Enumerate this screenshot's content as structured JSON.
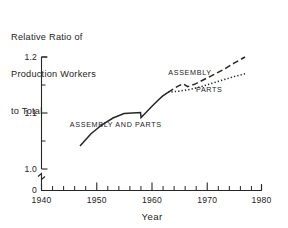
{
  "chart_data": {
    "type": "line",
    "title": "Relative Ratio of Production Workers to Total",
    "title_lines": [
      "Relative Ratio of",
      "Production Workers",
      "to Total"
    ],
    "xlabel": "Year",
    "ylabel": "",
    "xlim": [
      1940,
      1980
    ],
    "ylim": [
      1.0,
      1.2
    ],
    "y_axis_break": true,
    "y_break_label": "0",
    "grid": false,
    "legend": "inline-annotations",
    "yticks": [
      1.0,
      1.1,
      1.2
    ],
    "ytick_labels": [
      "1.0",
      "1.1",
      "1.2"
    ],
    "yticks_minor": [
      1.05,
      1.15
    ],
    "xticks": [
      1940,
      1950,
      1960,
      1970,
      1980
    ],
    "xtick_labels": [
      "1940",
      "1950",
      "1960",
      "1970",
      "1980"
    ],
    "xticks_minor": [
      1942,
      1944,
      1946,
      1948,
      1952,
      1954,
      1956,
      1958,
      1962,
      1964,
      1966,
      1968,
      1972,
      1974,
      1976,
      1978
    ],
    "series": [
      {
        "name": "ASSEMBLY AND PARTS",
        "style": "solid",
        "label": "ASSEMBLY AND PARTS",
        "x": [
          1947,
          1949,
          1951,
          1953,
          1955,
          1956.5,
          1958,
          1958.1,
          1959,
          1960,
          1961,
          1962,
          1963
        ],
        "values": [
          1.041,
          1.063,
          1.079,
          1.091,
          1.099,
          1.1,
          1.101,
          1.092,
          1.101,
          1.111,
          1.121,
          1.13,
          1.137
        ]
      },
      {
        "name": "ASSEMBLY",
        "style": "dashed",
        "label": "ASSEMBLY",
        "x": [
          1963,
          1964,
          1965,
          1965.8,
          1966.6,
          1968,
          1970,
          1973,
          1975,
          1977
        ],
        "values": [
          1.137,
          1.143,
          1.149,
          1.152,
          1.147,
          1.152,
          1.162,
          1.177,
          1.189,
          1.2
        ]
      },
      {
        "name": "PARTS",
        "style": "dotted",
        "label": "PARTS",
        "x": [
          1963,
          1965,
          1967,
          1969,
          1971,
          1973,
          1975,
          1977
        ],
        "values": [
          1.137,
          1.139,
          1.142,
          1.147,
          1.153,
          1.159,
          1.165,
          1.17
        ]
      }
    ],
    "annotations": [
      {
        "text": "ASSEMBLY AND PARTS",
        "x": 1953.5,
        "y": 1.075
      },
      {
        "text": "ASSEMBLY",
        "x": 1967.0,
        "y": 1.168
      },
      {
        "text": "PARTS",
        "x": 1970.5,
        "y": 1.137
      }
    ],
    "colors": {
      "line": "#262626",
      "text": "#232323",
      "background": "#ffffff"
    }
  }
}
